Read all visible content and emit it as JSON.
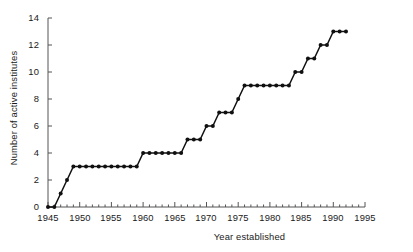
{
  "chart_data": {
    "type": "line",
    "title": "",
    "xlabel": "Year established",
    "ylabel": "Number of active institutes",
    "xlim": [
      1945,
      1995
    ],
    "ylim": [
      0,
      14
    ],
    "xticks": [
      1945,
      1950,
      1955,
      1960,
      1965,
      1970,
      1975,
      1980,
      1985,
      1990,
      1995
    ],
    "yticks": [
      0,
      2,
      4,
      6,
      8,
      10,
      12,
      14
    ],
    "x_minor_tick_interval": 1,
    "grid": false,
    "legend": null,
    "marker": "filled-circle",
    "line_style": "solid",
    "series": [
      {
        "name": "Number of active institutes",
        "x": [
          1945,
          1946,
          1947,
          1948,
          1949,
          1950,
          1951,
          1952,
          1953,
          1954,
          1955,
          1956,
          1957,
          1958,
          1959,
          1960,
          1961,
          1962,
          1963,
          1964,
          1965,
          1966,
          1967,
          1968,
          1969,
          1970,
          1971,
          1972,
          1973,
          1974,
          1975,
          1976,
          1977,
          1978,
          1979,
          1980,
          1981,
          1982,
          1983,
          1984,
          1985,
          1986,
          1987,
          1988,
          1989,
          1990,
          1991,
          1992
        ],
        "values": [
          0,
          0,
          1,
          2,
          3,
          3,
          3,
          3,
          3,
          3,
          3,
          3,
          3,
          3,
          3,
          4,
          4,
          4,
          4,
          4,
          4,
          4,
          5,
          5,
          5,
          6,
          6,
          7,
          7,
          7,
          8,
          9,
          9,
          9,
          9,
          9,
          9,
          9,
          9,
          10,
          10,
          11,
          11,
          12,
          12,
          13,
          13,
          13
        ]
      }
    ]
  },
  "axis_labels": {
    "y_0": "0",
    "y_2": "2",
    "y_4": "4",
    "y_6": "6",
    "y_8": "8",
    "y_10": "10",
    "y_12": "12",
    "y_14": "14",
    "x_1945": "1945",
    "x_1950": "1950",
    "x_1955": "1955",
    "x_1960": "1960",
    "x_1965": "1965",
    "x_1970": "1970",
    "x_1975": "1975",
    "x_1980": "1980",
    "x_1985": "1985",
    "x_1990": "1990",
    "x_1995": "1995"
  },
  "colors": {
    "line": "#101010",
    "marker": "#101010",
    "axis": "#555555",
    "text": "#1a1a1a",
    "background": "#ffffff"
  }
}
